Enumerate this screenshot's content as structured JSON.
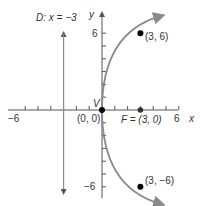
{
  "figure": {
    "type": "parabola-graph",
    "equation_description": "Parabola with vertex at origin, focus F=(3,0), directrix x=-3, opening right",
    "colors": {
      "axis": "#555555",
      "curve": "#8a8a8a",
      "point": "#000000",
      "text": "#333333"
    },
    "axes": {
      "x_label": "x",
      "y_label": "y",
      "x_ticks": [
        -6,
        -5,
        -4,
        -3,
        -2,
        -1,
        1,
        2,
        3,
        4,
        5,
        6
      ],
      "y_ticks": [
        -6,
        -5,
        -4,
        -3,
        -2,
        -1,
        1,
        2,
        3,
        4,
        5,
        6
      ],
      "x_tick_labels": {
        "neg": "−6",
        "pos": "6"
      },
      "y_tick_labels": {
        "pos": "6",
        "neg": "−6"
      }
    },
    "directrix": {
      "label": "D: x = −3",
      "x": -3
    },
    "vertex": {
      "label": "V",
      "coord_label": "(0, 0)",
      "x": 0,
      "y": 0
    },
    "focus": {
      "label": "F = (3, 0)",
      "x": 3,
      "y": 0
    },
    "points": [
      {
        "label": "(3, 6)",
        "x": 3,
        "y": 6
      },
      {
        "label": "(3, −6)",
        "x": 3,
        "y": -6
      }
    ]
  }
}
